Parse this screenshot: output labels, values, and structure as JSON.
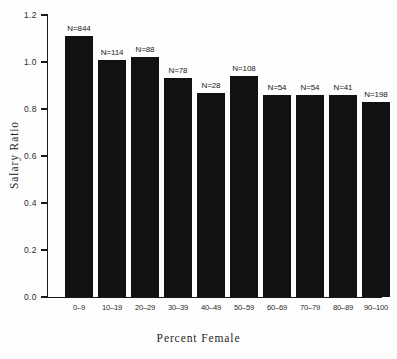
{
  "chart_data": {
    "type": "bar",
    "title": "",
    "xlabel": "Percent Female",
    "ylabel": "Salary Ratio",
    "categories": [
      "0–9",
      "10–19",
      "20–29",
      "30–39",
      "40–49",
      "50–59",
      "60–69",
      "70–79",
      "80–89",
      "90–100"
    ],
    "values": [
      1.11,
      1.01,
      1.02,
      0.93,
      0.87,
      0.94,
      0.86,
      0.86,
      0.86,
      0.83
    ],
    "point_labels": [
      "N=844",
      "N=114",
      "N=88",
      "N=78",
      "N=28",
      "N=108",
      "N=54",
      "N=54",
      "N=41",
      "N=198"
    ],
    "counts": [
      844,
      114,
      88,
      78,
      28,
      108,
      54,
      54,
      41,
      198
    ],
    "ylim": [
      0.0,
      1.2
    ],
    "ytick_labels": [
      "0.0",
      "0.2",
      "0.4",
      "0.6",
      "0.8",
      "1.0",
      "1.2"
    ],
    "ytick_values": [
      0.0,
      0.2,
      0.4,
      0.6,
      0.8,
      1.0,
      1.2
    ],
    "grid": false,
    "legend": "none",
    "bar_color": "#111111",
    "axis_color": "#1a1a1a",
    "background_color": "#fdfdfd"
  }
}
